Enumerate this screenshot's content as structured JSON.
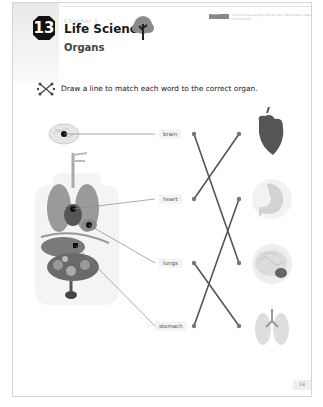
{
  "header": {
    "chapter_number": "13",
    "chapter_label": "Chapter 1",
    "title": "Life Science",
    "subtitle": "Organs",
    "tag": "Skills",
    "note": "The body has organs that do jobs. Match each organ to its picture."
  },
  "instruction": {
    "icon": "match-lines-icon",
    "text": "Draw a line to match each word to the correct organ."
  },
  "labels": [
    {
      "word": "brain"
    },
    {
      "word": "heart"
    },
    {
      "word": "lungs"
    },
    {
      "word": "stomach"
    }
  ],
  "organ_images": [
    "heart",
    "stomach",
    "brain",
    "lungs"
  ],
  "matches": [
    {
      "word": "brain",
      "image": "brain"
    },
    {
      "word": "heart",
      "image": "heart"
    },
    {
      "word": "lungs",
      "image": "lungs"
    },
    {
      "word": "stomach",
      "image": "stomach"
    }
  ],
  "footer": {
    "page_number": "13"
  },
  "colors": {
    "line": "#555555",
    "dot": "#777777",
    "heart": "#555555",
    "badge": "#111111"
  }
}
